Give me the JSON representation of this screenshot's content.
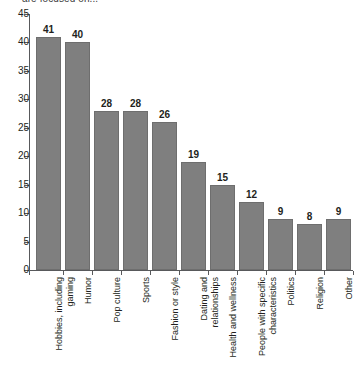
{
  "headline": "are focused on...",
  "chart_data": {
    "type": "bar",
    "title": "are focused on...",
    "xlabel": "",
    "ylabel": "",
    "ylim": [
      0,
      45
    ],
    "ytick_step": 5,
    "yticks": [
      45,
      40,
      35,
      30,
      25,
      20,
      15,
      10,
      5,
      0
    ],
    "grid": false,
    "legend": false,
    "bar_color": "#7f7f7f",
    "bar_edge_color": "#6e6e6e",
    "axis_color": "#58595b",
    "text_color": "#231f20",
    "categories": [
      "Hobbies, including gaming",
      "Humor",
      "Pop culture",
      "Sports",
      "Fashion or style",
      "Dating and relationships",
      "Health and wellness",
      "People with specific characteristics",
      "Politics",
      "Religion",
      "Other"
    ],
    "category_lines": [
      [
        "Hobbies, including",
        "gaming"
      ],
      [
        "Humor",
        ""
      ],
      [
        "Pop culture",
        ""
      ],
      [
        "Sports",
        ""
      ],
      [
        "Fashion or style",
        ""
      ],
      [
        "Dating and",
        "relationships"
      ],
      [
        "Health and wellness",
        ""
      ],
      [
        "People with specific",
        "characteristics"
      ],
      [
        "Politics",
        ""
      ],
      [
        "Religion",
        ""
      ],
      [
        "Other",
        ""
      ]
    ],
    "values": [
      41,
      40,
      28,
      28,
      26,
      19,
      15,
      12,
      9,
      8,
      9
    ],
    "value_labels": [
      "41",
      "40",
      "28",
      "28",
      "26",
      "19",
      "15",
      "12",
      "9",
      "8",
      "9"
    ]
  }
}
